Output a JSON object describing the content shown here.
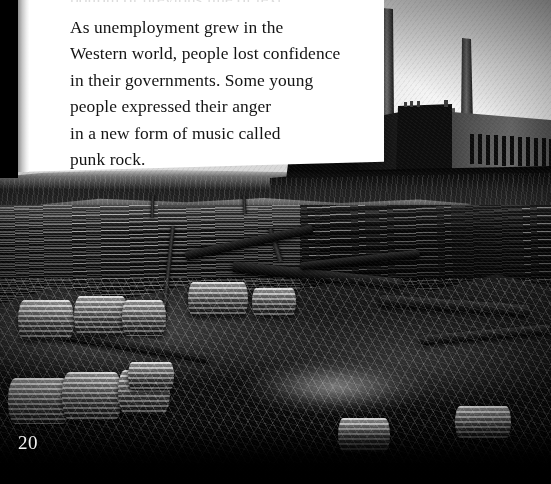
{
  "page": {
    "number": "20",
    "width": 551,
    "height": 484,
    "background_color": "#000000",
    "panel_color": "#ffffff",
    "text_color": "#141414",
    "page_number_color": "#f2f2f2"
  },
  "body": {
    "paragraph": "As unemployment grew in the\nWestern world, people lost confidence\nin their governments. Some young\npeople expressed their anger\nin a new form of music called\npunk rock.",
    "lines": [
      "As unemployment grew in the",
      "Western world, people lost confidence",
      "in their governments. Some young",
      "people expressed their anger",
      "in a new form of music called",
      "punk rock."
    ],
    "ghost_line": "bottom of previous line of text"
  },
  "photo": {
    "caption_absent": true,
    "description": "Black-and-white photograph of a polluted estuary shoreline strewn with rusting oil drums, timber and debris, with a coal-fired power station and two tall chimneys silhouetted on the far bank",
    "subjects": [
      "power-station",
      "chimney-tall",
      "chimney-short",
      "estuary-water",
      "oil-drums",
      "driftwood-debris"
    ],
    "tone": "monochrome"
  },
  "power_station": {
    "chimney_left": {
      "x": 382,
      "y": 8,
      "w": 11,
      "h": 112
    },
    "chimney_right": {
      "x": 462,
      "y": 38,
      "w": 9,
      "h": 82
    },
    "window_count": 11
  },
  "drums": [
    {
      "x": 8,
      "y": 378,
      "w": 62,
      "h": 46
    },
    {
      "x": 62,
      "y": 372,
      "w": 60,
      "h": 48
    },
    {
      "x": 118,
      "y": 370,
      "w": 52,
      "h": 44
    },
    {
      "x": 18,
      "y": 300,
      "w": 56,
      "h": 40
    },
    {
      "x": 74,
      "y": 296,
      "w": 54,
      "h": 40
    },
    {
      "x": 122,
      "y": 300,
      "w": 44,
      "h": 36
    },
    {
      "x": 188,
      "y": 282,
      "w": 60,
      "h": 34
    },
    {
      "x": 252,
      "y": 288,
      "w": 44,
      "h": 28
    },
    {
      "x": 338,
      "y": 418,
      "w": 52,
      "h": 34
    },
    {
      "x": 455,
      "y": 406,
      "w": 56,
      "h": 32
    },
    {
      "x": 128,
      "y": 362,
      "w": 46,
      "h": 28
    }
  ],
  "logs": [
    {
      "x": 184,
      "y": 238,
      "w": 130,
      "h": 9,
      "rot": -12
    },
    {
      "x": 232,
      "y": 270,
      "w": 170,
      "h": 11,
      "rot": 6
    },
    {
      "x": 300,
      "y": 256,
      "w": 120,
      "h": 8,
      "rot": -6
    },
    {
      "x": 60,
      "y": 342,
      "w": 150,
      "h": 10,
      "rot": 9
    },
    {
      "x": 380,
      "y": 300,
      "w": 150,
      "h": 12,
      "rot": 4
    },
    {
      "x": 420,
      "y": 330,
      "w": 130,
      "h": 10,
      "rot": -5
    }
  ],
  "poles": [
    {
      "x": 166,
      "y": 226,
      "w": 4,
      "h": 96,
      "rot": 6
    },
    {
      "x": 273,
      "y": 228,
      "w": 5,
      "h": 34,
      "rot": -18
    },
    {
      "x": 151,
      "y": 196,
      "w": 3,
      "h": 22,
      "rot": 2
    },
    {
      "x": 243,
      "y": 196,
      "w": 3,
      "h": 18,
      "rot": -3
    }
  ]
}
